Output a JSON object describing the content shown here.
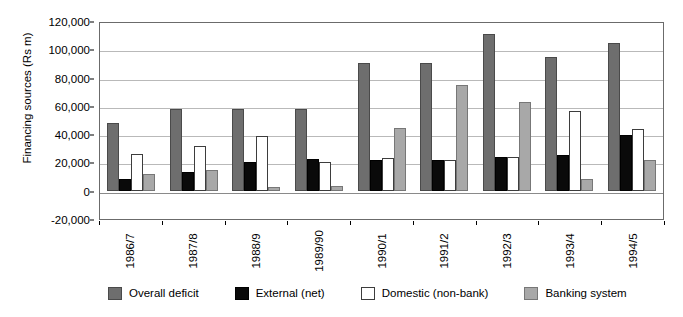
{
  "chart_data": {
    "type": "bar",
    "title": "",
    "xlabel": "",
    "ylabel": "Financing sources (Rs m)",
    "ylim": [
      -20000,
      120000
    ],
    "ytick_values": [
      120000,
      100000,
      80000,
      60000,
      40000,
      20000,
      0,
      -20000
    ],
    "ytick_labels": [
      "120,000",
      "100,000",
      "80,000",
      "60,000",
      "40,000",
      "20,000",
      "0",
      "-20,000"
    ],
    "grid": true,
    "legend_position": "bottom",
    "categories": [
      "1986/7",
      "1987/8",
      "1988/9",
      "1989/90",
      "1990/1",
      "1991/2",
      "1992/3",
      "1993/4",
      "1994/5"
    ],
    "series": [
      {
        "name": "Overall deficit",
        "color": "#6e6e6e",
        "values": [
          48000,
          57500,
          57500,
          58000,
          90000,
          90500,
          111000,
          94500,
          104500
        ]
      },
      {
        "name": "External (net)",
        "color": "#0a0a0a",
        "values": [
          8500,
          13500,
          20500,
          22500,
          21500,
          21500,
          24000,
          25500,
          39500
        ]
      },
      {
        "name": "Domestic (non-bank)",
        "color": "#ffffff",
        "values": [
          26000,
          31500,
          39000,
          20500,
          23000,
          21500,
          23500,
          56500,
          44000
        ]
      },
      {
        "name": "Banking system",
        "color": "#a8a8a8",
        "values": [
          11500,
          14500,
          2500,
          3500,
          44500,
          75000,
          63000,
          8500,
          22000
        ]
      }
    ]
  },
  "axis": {
    "y_title": "Financing sources (Rs m)"
  },
  "legend": {
    "items": [
      {
        "label": "Overall deficit"
      },
      {
        "label": "External (net)"
      },
      {
        "label": "Domestic (non-bank)"
      },
      {
        "label": "Banking system"
      }
    ]
  }
}
